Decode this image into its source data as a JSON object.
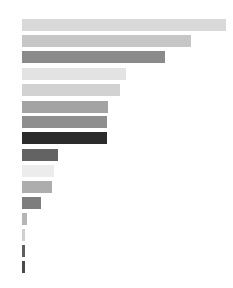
{
  "chart_data": {
    "type": "bar",
    "orientation": "horizontal",
    "title": "",
    "subtitle": "",
    "xlabel": "",
    "ylabel": "",
    "grid": false,
    "legend": "none",
    "axis_visible": false,
    "tick_labels_visible": false,
    "background_color": "#ffffff",
    "xlim": [
      0,
      100
    ],
    "categories": [
      "bar-1",
      "bar-2",
      "bar-3",
      "bar-4",
      "bar-5",
      "bar-6",
      "bar-7",
      "bar-8",
      "bar-9",
      "bar-10",
      "bar-11",
      "bar-12",
      "bar-13",
      "bar-14",
      "bar-15",
      "bar-16"
    ],
    "values": [
      100.0,
      82.8,
      70.2,
      51.2,
      48.3,
      42.1,
      41.6,
      41.5,
      17.6,
      15.7,
      14.6,
      9.3,
      2.4,
      1.5,
      1.5,
      1.5
    ],
    "colors": [
      "#d9d9d9",
      "#c6c6c6",
      "#8a8a8a",
      "#e3e3e3",
      "#d2d2d2",
      "#a3a3a3",
      "#8e8e8e",
      "#2b2b2b",
      "#636363",
      "#ececec",
      "#adadad",
      "#7d7d7d",
      "#b5b5b5",
      "#cfcfcf",
      "#5e5e5e",
      "#4a4a4a"
    ],
    "bar_pixel_lengths": [
      204,
      169,
      143,
      104,
      98,
      86,
      85,
      85,
      36,
      32,
      30,
      19,
      5,
      3,
      3,
      3
    ],
    "bar_pixel_tops": [
      19,
      35,
      51,
      68,
      84,
      101,
      116,
      132,
      149,
      165,
      181,
      197,
      213,
      229,
      245,
      261
    ],
    "bar_pixel_height": 12,
    "bar_pixel_left": 22
  }
}
